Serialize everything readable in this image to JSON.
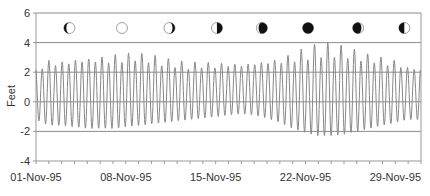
{
  "chart_data": {
    "type": "line",
    "title": "",
    "xlabel": "",
    "ylabel": "Feet",
    "ylim": [
      -4,
      6
    ],
    "yticks": [
      -4,
      -2,
      0,
      2,
      4,
      6
    ],
    "ytick_labels": [
      "-4",
      "-2",
      "0",
      "2",
      "4",
      "6"
    ],
    "xlim_days": [
      1,
      31
    ],
    "xticks_day": [
      1,
      8,
      15,
      22,
      29
    ],
    "xtick_labels": [
      "01-Nov-95",
      "08-Nov-95",
      "15-Nov-95",
      "22-Nov-95",
      "29-Nov-95"
    ],
    "grid": {
      "horizontal": true,
      "vertical": false,
      "color": "#888888"
    },
    "legend": null,
    "series": [
      {
        "name": "Water level (semidiurnal tide)",
        "color": "#888888",
        "cycles_per_day": 1.9323,
        "daily": {
          "day": [
            1,
            2,
            3,
            4,
            5,
            6,
            7,
            8,
            9,
            10,
            11,
            12,
            13,
            14,
            15,
            16,
            17,
            18,
            19,
            20,
            21,
            22,
            23,
            24,
            25,
            26,
            27,
            28,
            29,
            30
          ],
          "high1": [
            2.3,
            2.8,
            2.7,
            2.8,
            2.9,
            3.0,
            3.2,
            3.3,
            3.3,
            3.2,
            3.0,
            2.8,
            2.7,
            2.7,
            2.6,
            2.6,
            2.5,
            2.6,
            2.7,
            2.9,
            3.3,
            3.7,
            4.0,
            4.0,
            3.8,
            3.5,
            3.2,
            3.0,
            2.8,
            2.3
          ],
          "high2": [
            2.0,
            2.5,
            2.4,
            2.7,
            2.7,
            2.7,
            2.6,
            2.7,
            2.8,
            2.6,
            2.4,
            2.3,
            2.2,
            2.3,
            2.3,
            2.4,
            2.4,
            2.5,
            2.6,
            2.6,
            2.7,
            2.8,
            3.0,
            3.0,
            3.0,
            2.8,
            2.7,
            2.5,
            2.4,
            2.2
          ],
          "low": [
            -1.2,
            -1.6,
            -1.6,
            -1.7,
            -1.8,
            -1.8,
            -1.8,
            -1.7,
            -1.6,
            -1.5,
            -1.4,
            -1.3,
            -1.2,
            -1.1,
            -1.0,
            -0.9,
            -0.8,
            -0.9,
            -1.1,
            -1.4,
            -1.8,
            -2.1,
            -2.3,
            -2.3,
            -2.2,
            -2.0,
            -1.8,
            -1.6,
            -1.4,
            -1.2
          ]
        }
      }
    ],
    "annotations": {
      "moon_phases": [
        {
          "day": 3.6,
          "phase": "waning-left-dark-crescent"
        },
        {
          "day": 7.7,
          "phase": "full-moon"
        },
        {
          "day": 11.4,
          "phase": "waning-right-dark-crescent"
        },
        {
          "day": 15.1,
          "phase": "last-quarter"
        },
        {
          "day": 18.6,
          "phase": "waning-crescent"
        },
        {
          "day": 22.2,
          "phase": "new-moon"
        },
        {
          "day": 26.1,
          "phase": "waxing-crescent"
        },
        {
          "day": 29.7,
          "phase": "first-quarter"
        }
      ]
    }
  },
  "colors": {
    "line": "#8a8a8a",
    "grid": "#8c8c8c",
    "axis": "#999999",
    "text": "#333333",
    "moon_dark": "#111111",
    "moon_light": "#ffffff",
    "moon_outline": "#888888"
  }
}
